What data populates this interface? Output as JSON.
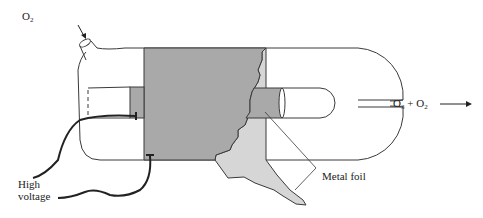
{
  "diagram": {
    "labels": {
      "inlet_gas": "O",
      "inlet_gas_sub": "2",
      "outlet_o3": "O",
      "outlet_o3_sub": "3",
      "outlet_plus": " + ",
      "outlet_o2": "O",
      "outlet_o2_sub": "2",
      "high_voltage_line1": "High",
      "high_voltage_line2": "voltage",
      "metal_foil": "Metal foil"
    },
    "colors": {
      "outline": "#3a3a3a",
      "foil_dark": "#a9a9a9",
      "foil_light": "#d6d6d6",
      "wire": "#222222",
      "background": "#ffffff"
    },
    "components": [
      "outer glass tube",
      "inner glass tube",
      "outer metal foil electrode",
      "inner metal foil electrode",
      "high voltage leads",
      "gas inlet",
      "gas outlet"
    ]
  }
}
